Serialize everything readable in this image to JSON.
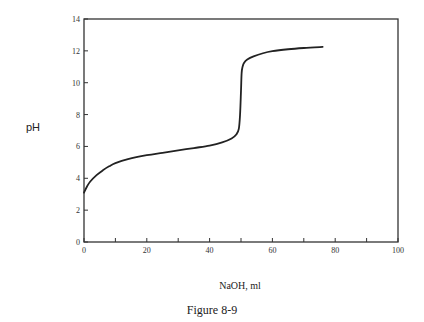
{
  "chart_data": {
    "type": "line",
    "title": "",
    "caption": "Figure 8-9",
    "xlabel": "NaOH, ml",
    "ylabel": "pH",
    "xlim": [
      0,
      100
    ],
    "ylim": [
      0,
      14
    ],
    "xticks": [
      0,
      10,
      20,
      30,
      40,
      50,
      60,
      70,
      80,
      90,
      100
    ],
    "xtick_labels": [
      "0",
      "",
      "20",
      "",
      "40",
      "",
      "60",
      "",
      "80",
      "",
      "100"
    ],
    "yticks": [
      0,
      2,
      4,
      6,
      8,
      10,
      12,
      14
    ],
    "ytick_labels": [
      "0",
      "2",
      "4",
      "6",
      "8",
      "10",
      "12",
      "14"
    ],
    "grid": false,
    "legend": "none",
    "series": [
      {
        "name": "titration curve",
        "x": [
          0,
          1,
          2,
          4,
          6,
          8,
          10,
          14,
          20,
          25,
          30,
          35,
          40,
          44,
          47,
          48.5,
          49.3,
          49.7,
          50,
          50.2,
          50.5,
          51,
          52,
          54,
          57,
          60,
          65,
          70,
          76
        ],
        "y": [
          3.1,
          3.5,
          3.8,
          4.2,
          4.5,
          4.75,
          4.95,
          5.2,
          5.45,
          5.6,
          5.75,
          5.9,
          6.05,
          6.25,
          6.5,
          6.75,
          7.1,
          8.0,
          9.5,
          10.6,
          11.0,
          11.25,
          11.45,
          11.65,
          11.85,
          11.98,
          12.1,
          12.18,
          12.25
        ]
      }
    ]
  }
}
